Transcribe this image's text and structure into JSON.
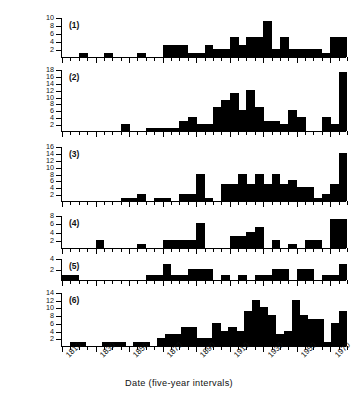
{
  "figure": {
    "ylabel": "Number of Components, By Region",
    "xlabel": "Date (five-year intervals)"
  },
  "chart_data": {
    "type": "bar",
    "title": "",
    "xlabel": "Date (five-year intervals)",
    "ylabel": "Number of Components, By Region",
    "grid": false,
    "legend": false,
    "bin_width_years": 5,
    "x": [
      1810,
      1815,
      1820,
      1825,
      1830,
      1835,
      1840,
      1845,
      1850,
      1855,
      1860,
      1865,
      1870,
      1875,
      1880,
      1885,
      1890,
      1895,
      1900,
      1905,
      1910,
      1915,
      1920,
      1925,
      1930,
      1935,
      1940,
      1945,
      1950,
      1955,
      1960,
      1965,
      1970,
      1975
    ],
    "xticklabels": [
      "1810",
      "1830",
      "1850",
      "1870",
      "1890",
      "1910",
      "1930",
      "1950",
      "1970"
    ],
    "xtickvalues": [
      1810,
      1830,
      1850,
      1870,
      1890,
      1910,
      1930,
      1950,
      1970
    ],
    "xlim": [
      1808,
      1978
    ],
    "panels": [
      {
        "name": "(1)",
        "ylim": [
          0,
          10
        ],
        "yticks": [
          2,
          4,
          6,
          8,
          10
        ],
        "values": [
          0,
          0,
          1,
          0,
          0,
          1,
          0,
          0,
          0,
          1,
          0,
          0,
          3,
          3,
          3,
          1,
          1,
          3,
          2,
          2,
          5,
          3,
          5,
          5,
          9,
          2,
          5,
          2,
          2,
          2,
          2,
          1,
          5,
          5
        ]
      },
      {
        "name": "(2)",
        "ylim": [
          0,
          18
        ],
        "yticks": [
          2,
          4,
          6,
          8,
          10,
          12,
          14,
          16,
          18
        ],
        "values": [
          0,
          0,
          0,
          0,
          0,
          0,
          0,
          2,
          0,
          0,
          1,
          1,
          1,
          1,
          3,
          4,
          2,
          2,
          7,
          9,
          11,
          6,
          12,
          7,
          3,
          3,
          2,
          6,
          4,
          0,
          0,
          4,
          2,
          17
        ]
      },
      {
        "name": "(3)",
        "ylim": [
          0,
          16
        ],
        "yticks": [
          2,
          4,
          6,
          8,
          10,
          12,
          14,
          16
        ],
        "values": [
          0,
          0,
          0,
          0,
          0,
          0,
          0,
          1,
          1,
          2,
          0,
          1,
          1,
          0,
          2,
          2,
          8,
          1,
          0,
          5,
          5,
          8,
          5,
          8,
          5,
          8,
          5,
          6,
          4,
          4,
          1,
          2,
          5,
          14
        ]
      },
      {
        "name": "(4)",
        "ylim": [
          0,
          8
        ],
        "yticks": [
          2,
          4,
          6,
          8
        ],
        "values": [
          0,
          0,
          0,
          0,
          2,
          0,
          0,
          0,
          0,
          1,
          0,
          0,
          2,
          2,
          2,
          2,
          6,
          0,
          0,
          0,
          3,
          3,
          4,
          5,
          0,
          2,
          0,
          1,
          0,
          2,
          2,
          0,
          7,
          7
        ]
      },
      {
        "name": "(5)",
        "ylim": [
          0,
          4
        ],
        "yticks": [
          2,
          4
        ],
        "values": [
          1,
          1,
          0,
          0,
          0,
          0,
          0,
          0,
          0,
          0,
          1,
          1,
          3,
          1,
          1,
          2,
          2,
          2,
          0,
          1,
          0,
          1,
          0,
          1,
          1,
          2,
          2,
          0,
          2,
          2,
          0,
          1,
          1,
          3
        ]
      },
      {
        "name": "(6)",
        "ylim": [
          0,
          14
        ],
        "yticks": [
          2,
          4,
          6,
          8,
          10,
          12,
          14
        ],
        "values": [
          0,
          1,
          1,
          0,
          0,
          1,
          1,
          1,
          0,
          1,
          1,
          0,
          2,
          3,
          3,
          5,
          5,
          2,
          2,
          6,
          4,
          5,
          4,
          9,
          12,
          10,
          8,
          3,
          4,
          12,
          8,
          7,
          7,
          1,
          6,
          9
        ]
      }
    ]
  }
}
